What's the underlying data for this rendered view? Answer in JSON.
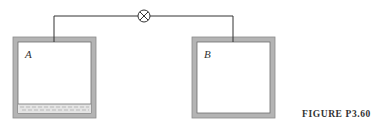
{
  "figure": {
    "caption": "FIGURE P3.60",
    "tank_a": {
      "label": "A",
      "contains_liquid": true
    },
    "tank_b": {
      "label": "B",
      "contains_liquid": false
    },
    "valve": {
      "symbol": "valve-x-circle",
      "connects": [
        "A",
        "B"
      ]
    },
    "colors": {
      "wall": "#b4b4b4",
      "wall_edge": "#6e6e6e",
      "pipe": "#333333",
      "liquid_lines": "#8a8a8a"
    }
  }
}
